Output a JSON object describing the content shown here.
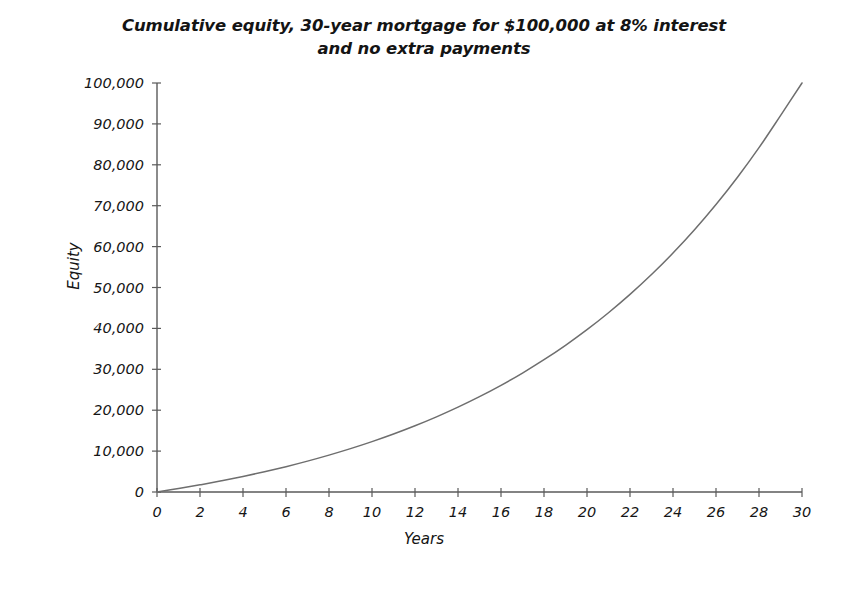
{
  "chart_data": {
    "type": "line",
    "title": "Cumulative equity, 30-year mortgage for $100,000 at 8% interest\nand no extra payments",
    "xlabel": "Years",
    "ylabel": "Equity",
    "xlim": [
      0,
      30
    ],
    "ylim": [
      0,
      100000
    ],
    "grid": false,
    "legend": null,
    "line_color": "#6e6e6e",
    "axis_color": "#5a5a5a",
    "background_color": "#ffffff",
    "x_tick_labels": [
      "0",
      "2",
      "4",
      "6",
      "8",
      "10",
      "12",
      "14",
      "16",
      "18",
      "20",
      "22",
      "24",
      "26",
      "28",
      "30"
    ],
    "x_tick_values": [
      0,
      2,
      4,
      6,
      8,
      10,
      12,
      14,
      16,
      18,
      20,
      22,
      24,
      26,
      28,
      30
    ],
    "y_tick_labels": [
      "0",
      "10,000",
      "20,000",
      "30,000",
      "40,000",
      "50,000",
      "60,000",
      "70,000",
      "80,000",
      "90,000",
      "100,000"
    ],
    "y_tick_values": [
      0,
      10000,
      20000,
      30000,
      40000,
      50000,
      60000,
      70000,
      80000,
      90000,
      100000
    ],
    "series": [
      {
        "name": "Cumulative equity",
        "x": [
          0,
          1,
          2,
          3,
          4,
          5,
          6,
          7,
          8,
          9,
          10,
          11,
          12,
          13,
          14,
          15,
          16,
          17,
          18,
          19,
          20,
          21,
          22,
          23,
          24,
          25,
          26,
          27,
          28,
          29,
          30
        ],
        "values": [
          0,
          838,
          1746,
          2729,
          3794,
          4947,
          6196,
          7549,
          9014,
          10600,
          12319,
          14180,
          16196,
          18380,
          20745,
          23307,
          26082,
          29088,
          32343,
          35870,
          39689,
          43826,
          48307,
          53160,
          58416,
          64110,
          70276,
          76956,
          84191,
          92028,
          100000
        ]
      }
    ]
  }
}
